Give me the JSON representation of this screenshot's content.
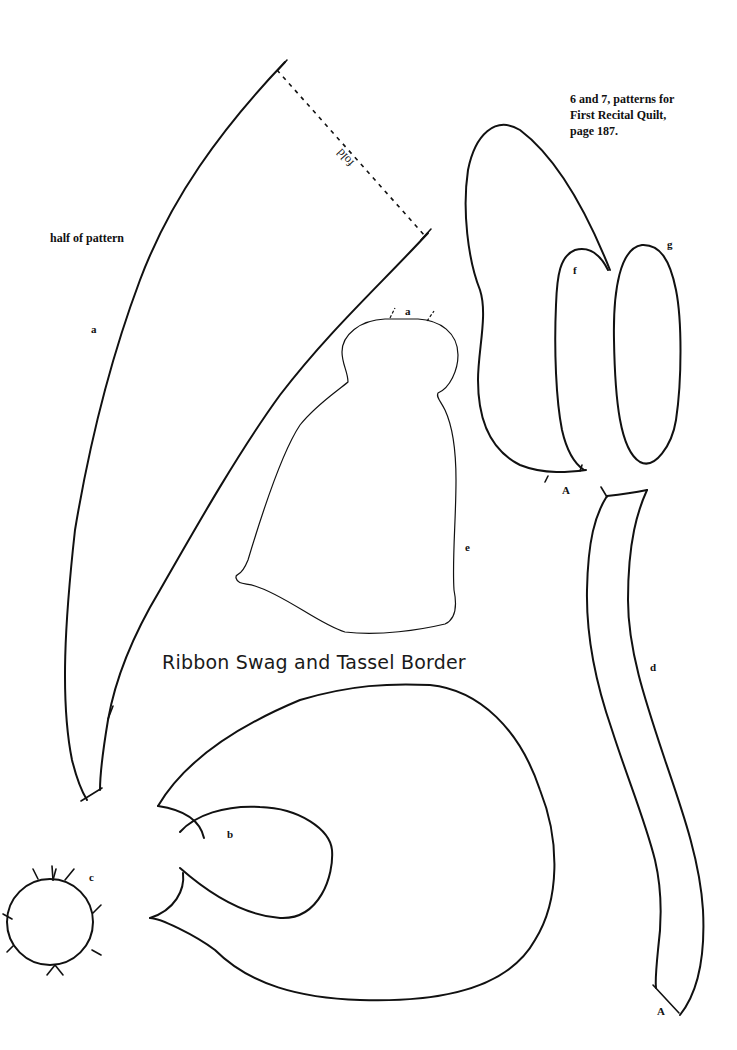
{
  "page": {
    "title": "Ribbon Swag and Tassel Border",
    "caption": {
      "line1": "6 and 7, patterns for",
      "line2": "First Recital Quilt,",
      "line3": "page 187."
    },
    "half_note": "half of pattern",
    "fold_label": "fold"
  },
  "pieces": {
    "a": {
      "label": "a",
      "name": "swag half piece"
    },
    "a_notch": {
      "label": "a"
    },
    "b": {
      "label": "b",
      "name": "ribbon loop"
    },
    "c": {
      "label": "c",
      "name": "round knot"
    },
    "d": {
      "label": "d",
      "name": "ribbon tail strip"
    },
    "d_end": {
      "label": "A"
    },
    "e": {
      "label": "e",
      "name": "tassel"
    },
    "f": {
      "label": "f",
      "name": "inner petal"
    },
    "g": {
      "label": "g",
      "name": "oval petal"
    },
    "f_notch": {
      "label": "A"
    }
  },
  "colors": {
    "ink": "#111111",
    "paper": "#ffffff"
  }
}
